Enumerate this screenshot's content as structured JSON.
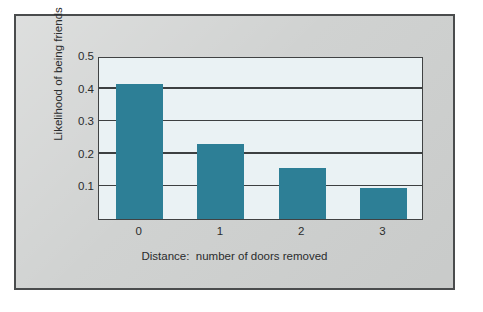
{
  "chart_data": {
    "type": "bar",
    "title": "",
    "categories": [
      "0",
      "1",
      "2",
      "3"
    ],
    "values": [
      0.415,
      0.23,
      0.155,
      0.095
    ],
    "series": [
      {
        "name": "Likelihood of being friends",
        "values": [
          0.415,
          0.23,
          0.155,
          0.095
        ]
      }
    ],
    "xlabel": "Distance:  number of doors removed",
    "ylabel": "Likelihood of being friends",
    "ylim": [
      0,
      0.5
    ],
    "y_ticks": [
      0.1,
      0.2,
      0.3,
      0.4,
      0.5
    ],
    "y_tick_labels": [
      "0.1",
      "0.2",
      "0.3",
      "0.4",
      "0.5"
    ],
    "grid": true,
    "grid_axis": "y",
    "legend": false,
    "legend_position": "none",
    "bar_color": "#2d7f96",
    "plot_background": "#eaf2f4",
    "panel_background": "#cfd1d0",
    "axis_color": "#3d4041"
  }
}
